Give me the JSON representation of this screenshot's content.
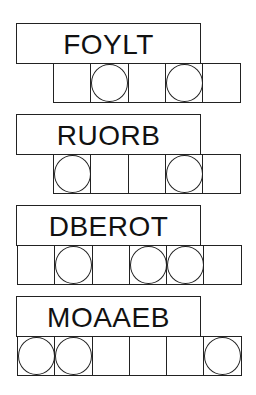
{
  "puzzles": [
    {
      "scrambled": "FOYLT",
      "cells": 5,
      "circled": [
        2,
        4
      ],
      "top": 23,
      "cells_left": 53
    },
    {
      "scrambled": "RUORB",
      "cells": 5,
      "circled": [
        1,
        4
      ],
      "top": 114,
      "cells_left": 53
    },
    {
      "scrambled": "DBEROT",
      "cells": 6,
      "circled": [
        2,
        4,
        5
      ],
      "top": 205,
      "cells_left": 17
    },
    {
      "scrambled": "MOAAEB",
      "cells": 6,
      "circled": [
        1,
        2,
        6
      ],
      "top": 296,
      "cells_left": 17
    }
  ]
}
